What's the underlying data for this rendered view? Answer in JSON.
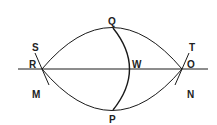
{
  "diagram": {
    "type": "geometric-construction",
    "labels": {
      "S": "S",
      "R": "R",
      "M": "M",
      "Q": "Q",
      "W": "W",
      "P": "P",
      "T": "T",
      "O": "O",
      "N": "N"
    },
    "colors": {
      "line": "#1a1a1a",
      "text": "#222222",
      "background": "#ffffff"
    }
  }
}
